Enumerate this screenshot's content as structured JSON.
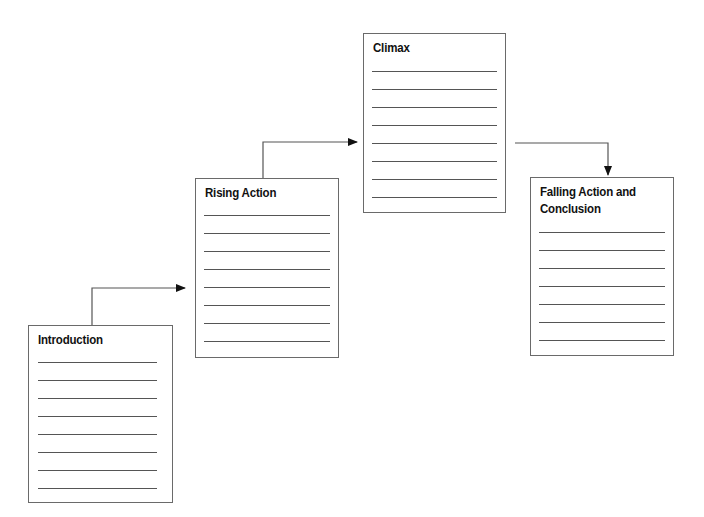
{
  "diagram": {
    "type": "plot-structure-staircase",
    "stages": [
      {
        "id": "introduction",
        "title": "Introduction",
        "lines": 8
      },
      {
        "id": "rising-action",
        "title": "Rising Action",
        "lines": 8
      },
      {
        "id": "climax",
        "title": "Climax",
        "lines": 8
      },
      {
        "id": "falling-action",
        "title": "Falling Action and Conclusion",
        "lines": 7
      }
    ],
    "connections": [
      {
        "from": "introduction",
        "to": "rising-action"
      },
      {
        "from": "rising-action",
        "to": "climax"
      },
      {
        "from": "climax",
        "to": "falling-action"
      }
    ]
  }
}
